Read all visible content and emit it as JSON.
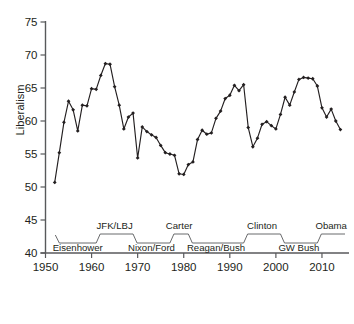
{
  "chart_data": {
    "type": "line",
    "title": "",
    "xlabel": "",
    "ylabel": "Liberalism",
    "xlim": [
      1950,
      2015
    ],
    "ylim": [
      40,
      75
    ],
    "grid": false,
    "legend": "none",
    "xticks": [
      1950,
      1960,
      1970,
      1980,
      1990,
      2000,
      2010
    ],
    "xticklabels": [
      "1950",
      "1960",
      "1970",
      "1980",
      "1990",
      "2000",
      "2010"
    ],
    "yticks": [
      40,
      45,
      50,
      55,
      60,
      65,
      70,
      75
    ],
    "yticklabels": [
      "40",
      "45",
      "50",
      "55",
      "60",
      "65",
      "70",
      "75"
    ],
    "marker": "diamond",
    "series": [
      {
        "name": "Liberalism",
        "x": [
          1952,
          1953,
          1954,
          1955,
          1956,
          1957,
          1958,
          1959,
          1960,
          1961,
          1962,
          1963,
          1964,
          1965,
          1966,
          1967,
          1968,
          1969,
          1970,
          1971,
          1972,
          1973,
          1974,
          1975,
          1976,
          1977,
          1978,
          1979,
          1980,
          1981,
          1982,
          1983,
          1984,
          1985,
          1986,
          1987,
          1988,
          1989,
          1990,
          1991,
          1992,
          1993,
          1994,
          1995,
          1996,
          1997,
          1998,
          1999,
          2000,
          2001,
          2002,
          2003,
          2004,
          2005,
          2006,
          2007,
          2008,
          2009,
          2010,
          2011,
          2012,
          2013,
          2014
        ],
        "values": [
          50.7,
          55.2,
          59.8,
          63.0,
          61.7,
          58.5,
          62.4,
          62.3,
          64.9,
          64.8,
          66.9,
          68.7,
          68.6,
          65.2,
          62.4,
          58.8,
          60.6,
          61.2,
          54.4,
          59.1,
          58.4,
          57.9,
          57.5,
          56.3,
          55.2,
          55.0,
          54.8,
          52.0,
          51.9,
          53.4,
          53.8,
          57.2,
          58.6,
          58.0,
          58.2,
          60.4,
          61.5,
          63.4,
          63.9,
          65.4,
          64.6,
          65.5,
          59.0,
          56.1,
          57.4,
          59.5,
          59.9,
          59.3,
          58.8,
          61.0,
          63.6,
          62.4,
          64.4,
          66.3,
          66.6,
          66.5,
          66.4,
          65.3,
          62.0,
          60.6,
          61.8,
          60.0,
          58.7
        ]
      }
    ],
    "annotations": {
      "administrations": [
        {
          "label": "Eisenhower",
          "start": 1953,
          "end": 1961,
          "level": "lower"
        },
        {
          "label": "JFK/LBJ",
          "start": 1961,
          "end": 1969,
          "level": "upper"
        },
        {
          "label": "Nixon/Ford",
          "start": 1969,
          "end": 1977,
          "level": "lower"
        },
        {
          "label": "Carter",
          "start": 1977,
          "end": 1981,
          "level": "upper"
        },
        {
          "label": "Reagan/Bush",
          "start": 1981,
          "end": 1993,
          "level": "lower"
        },
        {
          "label": "Clinton",
          "start": 1993,
          "end": 2001,
          "level": "upper"
        },
        {
          "label": "GW Bush",
          "start": 2001,
          "end": 2009,
          "level": "lower"
        },
        {
          "label": "Obama",
          "start": 2009,
          "end": 2015,
          "level": "upper"
        }
      ]
    }
  }
}
